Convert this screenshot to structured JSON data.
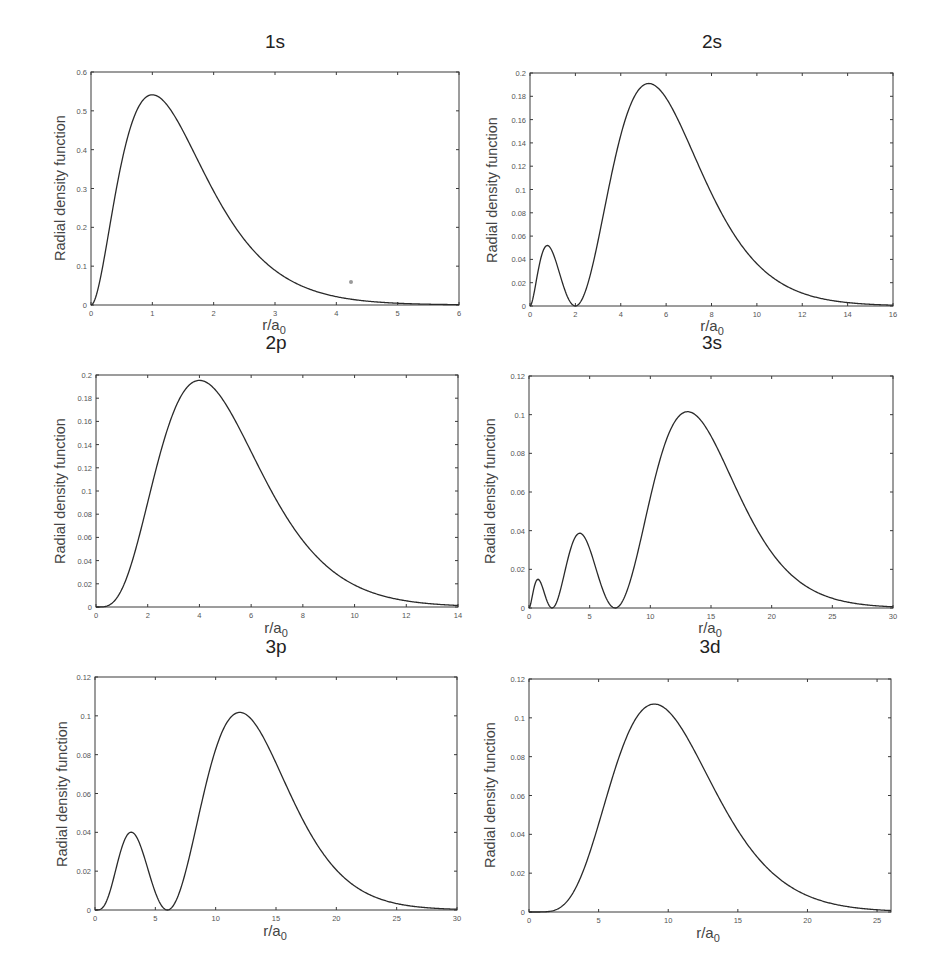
{
  "figure": {
    "background": "#ffffff",
    "line_color": "#2a2a2a",
    "frame_color": "#3a3a3a"
  },
  "chart_data": [
    {
      "id": "1s",
      "type": "line",
      "title": "1s",
      "xlabel": "r/a0",
      "xlabel_main": "r/a",
      "xlabel_sub": "0",
      "ylabel": "Radial density function",
      "xlim": [
        0,
        6
      ],
      "ylim": [
        0,
        0.6
      ],
      "xticks": [
        "0",
        "1",
        "2",
        "3",
        "4",
        "5",
        "6"
      ],
      "xtick_values": [
        0,
        1,
        2,
        3,
        4,
        5,
        6
      ],
      "yticks": [
        "0",
        "0.1",
        "0.2",
        "0.3",
        "0.4",
        "0.5",
        "0.6"
      ],
      "ytick_values": [
        0,
        0.1,
        0.2,
        0.3,
        0.4,
        0.5,
        0.6
      ],
      "grid": false,
      "orbital": {
        "n": 1,
        "l": 0
      },
      "x": [
        0,
        0.5,
        1,
        1.5,
        2,
        2.5,
        3,
        4,
        5,
        6
      ],
      "y": [
        0,
        0.368,
        0.541,
        0.448,
        0.293,
        0.168,
        0.089,
        0.0215,
        0.0045,
        0.0009
      ],
      "peaks": [
        {
          "x": 1.0,
          "y": 0.541
        }
      ],
      "nodes": [],
      "frame": {
        "left": 91,
        "top": 72,
        "right": 459,
        "bottom": 305
      },
      "title_pos": {
        "x": 275,
        "y": 43
      },
      "ylabel_pos": {
        "x": 60,
        "y": 188
      },
      "xlabel_pos": {
        "x": 274,
        "y": 316
      }
    },
    {
      "id": "2s",
      "type": "line",
      "title": "2s",
      "xlabel": "r/a0",
      "xlabel_main": "r/a",
      "xlabel_sub": "0",
      "ylabel": "Radial density function",
      "xlim": [
        0,
        16
      ],
      "ylim": [
        0,
        0.2
      ],
      "xticks": [
        "0",
        "2",
        "4",
        "6",
        "8",
        "10",
        "12",
        "14",
        "16"
      ],
      "xtick_values": [
        0,
        2,
        4,
        6,
        8,
        10,
        12,
        14,
        16
      ],
      "yticks": [
        "0",
        "0.02",
        "0.04",
        "0.06",
        "0.08",
        "0.1",
        "0.12",
        "0.14",
        "0.16",
        "0.18",
        "0.2"
      ],
      "ytick_values": [
        0,
        0.02,
        0.04,
        0.06,
        0.08,
        0.1,
        0.12,
        0.14,
        0.16,
        0.18,
        0.2
      ],
      "grid": false,
      "orbital": {
        "n": 2,
        "l": 0
      },
      "x": [
        0,
        0.76,
        2,
        4,
        5.24,
        6,
        8,
        10,
        12,
        14,
        16
      ],
      "y": [
        0,
        0.052,
        0,
        0.1465,
        0.191,
        0.1785,
        0.0965,
        0.0363,
        0.0111,
        0.0029,
        0.0007
      ],
      "peaks": [
        {
          "x": 0.76,
          "y": 0.052
        },
        {
          "x": 5.24,
          "y": 0.191
        }
      ],
      "nodes": [
        2
      ],
      "frame": {
        "left": 530,
        "top": 73,
        "right": 893,
        "bottom": 306
      },
      "title_pos": {
        "x": 712,
        "y": 43
      },
      "ylabel_pos": {
        "x": 492,
        "y": 190
      },
      "xlabel_pos": {
        "x": 712,
        "y": 317
      }
    },
    {
      "id": "2p",
      "type": "line",
      "title": "2p",
      "xlabel": "r/a0",
      "xlabel_main": "r/a",
      "xlabel_sub": "0",
      "ylabel": "Radial density function",
      "xlim": [
        0,
        14
      ],
      "ylim": [
        0,
        0.2
      ],
      "xticks": [
        "0",
        "2",
        "4",
        "6",
        "8",
        "10",
        "12",
        "14"
      ],
      "xtick_values": [
        0,
        2,
        4,
        6,
        8,
        10,
        12,
        14
      ],
      "yticks": [
        "0",
        "0.02",
        "0.04",
        "0.06",
        "0.08",
        "0.1",
        "0.12",
        "0.14",
        "0.16",
        "0.18",
        "0.2"
      ],
      "ytick_values": [
        0,
        0.02,
        0.04,
        0.06,
        0.08,
        0.1,
        0.12,
        0.14,
        0.16,
        0.18,
        0.2
      ],
      "grid": false,
      "orbital": {
        "n": 2,
        "l": 1
      },
      "x": [
        0,
        1,
        2,
        3,
        4,
        5,
        6,
        8,
        10,
        12,
        14
      ],
      "y": [
        0,
        0.0153,
        0.09,
        0.168,
        0.195,
        0.175,
        0.134,
        0.0573,
        0.0189,
        0.0053,
        0.0013
      ],
      "peaks": [
        {
          "x": 4.0,
          "y": 0.195
        }
      ],
      "nodes": [],
      "frame": {
        "left": 96,
        "top": 375,
        "right": 458,
        "bottom": 607
      },
      "title_pos": {
        "x": 276,
        "y": 344
      },
      "ylabel_pos": {
        "x": 60,
        "y": 491
      },
      "xlabel_pos": {
        "x": 276,
        "y": 619
      }
    },
    {
      "id": "3s",
      "type": "line",
      "title": "3s",
      "xlabel": "r/a0",
      "xlabel_main": "r/a",
      "xlabel_sub": "0",
      "ylabel": "Radial density function",
      "xlim": [
        0,
        30
      ],
      "ylim": [
        0,
        0.12
      ],
      "xticks": [
        "0",
        "5",
        "10",
        "15",
        "20",
        "25",
        "30"
      ],
      "xtick_values": [
        0,
        5,
        10,
        15,
        20,
        25,
        30
      ],
      "yticks": [
        "0",
        "0.02",
        "0.04",
        "0.06",
        "0.08",
        "0.1",
        "0.12"
      ],
      "ytick_values": [
        0,
        0.02,
        0.04,
        0.06,
        0.08,
        0.1,
        0.12
      ],
      "grid": false,
      "orbital": {
        "n": 3,
        "l": 0
      },
      "x": [
        0,
        0.74,
        1.9,
        4.19,
        7.1,
        10,
        13.07,
        15,
        20,
        25,
        30
      ],
      "y": [
        0,
        0.015,
        0,
        0.0386,
        0,
        0.063,
        0.101,
        0.094,
        0.034,
        0.0065,
        0.001
      ],
      "peaks": [
        {
          "x": 0.74,
          "y": 0.015
        },
        {
          "x": 4.19,
          "y": 0.0386
        },
        {
          "x": 13.07,
          "y": 0.101
        }
      ],
      "nodes": [
        1.9,
        7.1
      ],
      "frame": {
        "left": 529,
        "top": 376,
        "right": 893,
        "bottom": 608
      },
      "title_pos": {
        "x": 712,
        "y": 344
      },
      "ylabel_pos": {
        "x": 490,
        "y": 491
      },
      "xlabel_pos": {
        "x": 710,
        "y": 619
      }
    },
    {
      "id": "3p",
      "type": "line",
      "title": "3p",
      "xlabel": "r/a0",
      "xlabel_main": "r/a",
      "xlabel_sub": "0",
      "ylabel": "Radial density function",
      "xlim": [
        0,
        30
      ],
      "ylim": [
        0,
        0.12
      ],
      "xticks": [
        "0",
        "5",
        "10",
        "15",
        "20",
        "25",
        "30"
      ],
      "xtick_values": [
        0,
        5,
        10,
        15,
        20,
        25,
        30
      ],
      "yticks": [
        "0",
        "0.02",
        "0.04",
        "0.06",
        "0.08",
        "0.1",
        "0.12"
      ],
      "ytick_values": [
        0,
        0.02,
        0.04,
        0.06,
        0.08,
        0.1,
        0.12
      ],
      "grid": false,
      "orbital": {
        "n": 3,
        "l": 1
      },
      "x": [
        0,
        1,
        3,
        6,
        10,
        12,
        15,
        20,
        25,
        30
      ],
      "y": [
        0,
        0.0079,
        0.04,
        0,
        0.087,
        0.101,
        0.082,
        0.023,
        0.004,
        0.0005
      ],
      "peaks": [
        {
          "x": 3.0,
          "y": 0.04
        },
        {
          "x": 12.0,
          "y": 0.101
        }
      ],
      "nodes": [
        6
      ],
      "frame": {
        "left": 95,
        "top": 677,
        "right": 457,
        "bottom": 910
      },
      "title_pos": {
        "x": 276,
        "y": 648
      },
      "ylabel_pos": {
        "x": 62,
        "y": 794
      },
      "xlabel_pos": {
        "x": 275,
        "y": 922
      }
    },
    {
      "id": "3d",
      "type": "line",
      "title": "3d",
      "xlabel": "r/a0",
      "xlabel_main": "r/a",
      "xlabel_sub": "0",
      "ylabel": "Radial density function",
      "xlim": [
        0,
        26
      ],
      "ylim": [
        0,
        0.12
      ],
      "xticks": [
        "0",
        "5",
        "10",
        "15",
        "20",
        "25"
      ],
      "xtick_values": [
        0,
        5,
        10,
        15,
        20,
        25
      ],
      "yticks": [
        "0",
        "0.02",
        "0.04",
        "0.06",
        "0.08",
        "0.1",
        "0.12"
      ],
      "ytick_values": [
        0,
        0.02,
        0.04,
        0.06,
        0.08,
        0.1,
        0.12
      ],
      "grid": false,
      "orbital": {
        "n": 3,
        "l": 2
      },
      "x": [
        0,
        2.5,
        5,
        7,
        9,
        10,
        12,
        15,
        20,
        25,
        26
      ],
      "y": [
        0,
        0.0049,
        0.0459,
        0.092,
        0.107,
        0.1035,
        0.083,
        0.042,
        0.0084,
        0.00115,
        0.0008
      ],
      "peaks": [
        {
          "x": 9.0,
          "y": 0.107
        }
      ],
      "nodes": [],
      "frame": {
        "left": 529,
        "top": 679,
        "right": 891,
        "bottom": 912
      },
      "title_pos": {
        "x": 710,
        "y": 648
      },
      "ylabel_pos": {
        "x": 490,
        "y": 795
      },
      "xlabel_pos": {
        "x": 708,
        "y": 924
      }
    }
  ],
  "artifacts": [
    {
      "name": "speck",
      "x": 349,
      "y": 280
    }
  ]
}
